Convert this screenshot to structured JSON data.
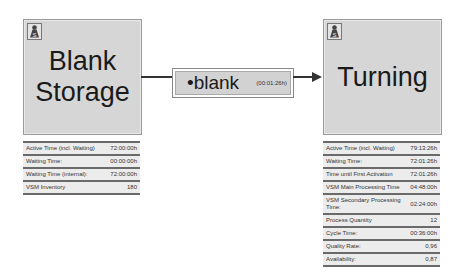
{
  "nodes": {
    "blank_storage": {
      "title_line1": "Blank",
      "title_line2": "Storage",
      "icon": "storage-icon",
      "stats": [
        {
          "label": "Active Time (incl. Waiting)",
          "value": "72:00:00h"
        },
        {
          "label": "Waiting Time:",
          "value": "00:00:00h"
        },
        {
          "label": "Waiting Time (internal):",
          "value": "72:00:00h"
        },
        {
          "label": "VSM Inventory",
          "value": "180"
        }
      ]
    },
    "transport": {
      "label": "•blank",
      "duration": "(00:01:26h)"
    },
    "turning": {
      "title": "Turning",
      "icon": "storage-icon",
      "stats": [
        {
          "label": "Active Time (incl. Waiting)",
          "value": "79:13:26h"
        },
        {
          "label": "Waiting Time:",
          "value": "72:01:26h"
        },
        {
          "label": "Time until First Activation",
          "value": "72:01:26h"
        },
        {
          "label": "VSM Main Processing Time",
          "value": "04:48:00h"
        },
        {
          "label": "VSM Secondary Processing Time:",
          "value": "02:24:00h"
        },
        {
          "label": "Process Quantity",
          "value": "12"
        },
        {
          "label": "Cycle Time:",
          "value": "00:36:00h"
        },
        {
          "label": "Quality Rate:",
          "value": "0,96"
        },
        {
          "label": "Availability:",
          "value": "0,87"
        }
      ]
    }
  },
  "colors": {
    "node_fill": "#d6d6d6",
    "connector": "#333333",
    "table_row": "#ececec"
  }
}
